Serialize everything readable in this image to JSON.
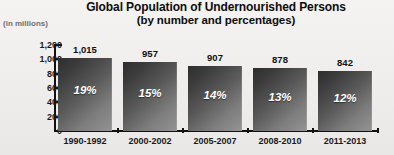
{
  "chart_data": {
    "type": "bar",
    "title": "Global Population of Undernourished Persons",
    "subtitle": "(by number and percentages)",
    "ylabel": "(in millions)",
    "xlabel": "",
    "ylim": [
      0,
      1200
    ],
    "yticks": [
      "0",
      "200",
      "400",
      "600",
      "800",
      "1,000",
      "1,200"
    ],
    "ytick_values": [
      0,
      200,
      400,
      600,
      800,
      1000,
      1200
    ],
    "grid": false,
    "legend": "none",
    "categories": [
      "1990-1992",
      "2000-2002",
      "2005-2007",
      "2008-2010",
      "2011-2013"
    ],
    "values": [
      1015,
      957,
      907,
      878,
      842
    ],
    "value_labels": [
      "1,015",
      "957",
      "907",
      "878",
      "842"
    ],
    "percent_labels": [
      "19%",
      "15%",
      "14%",
      "13%",
      "12%"
    ],
    "percent_values": [
      19,
      15,
      14,
      13,
      12
    ],
    "colors": {
      "background": "#f1f0ee",
      "bar_dark": "#2e2e2e",
      "bar_light": "#949494",
      "axis": "#111111",
      "text": "#111111",
      "caption": "#6f6f6f",
      "pct_text": "#ffffff"
    }
  }
}
